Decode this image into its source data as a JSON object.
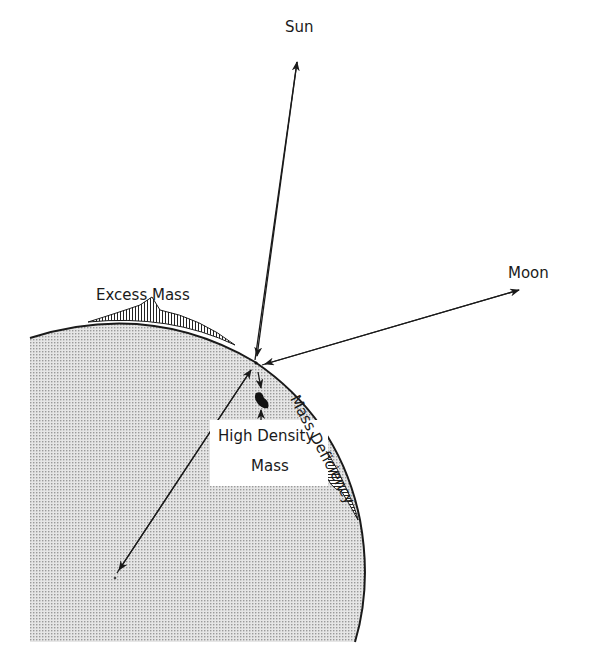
{
  "diagram": {
    "type": "tidal/gravity anomaly cross-section",
    "labels": {
      "sun": "Sun",
      "moon": "Moon",
      "excess_mass": "Excess Mass",
      "high_density_line1": "High Density",
      "high_density_line2": "Mass",
      "mass_deficiency": "Mass Deficiency"
    },
    "colors": {
      "earth_fill": "#d9d9d9",
      "line": "#1a1a1a",
      "background": "#ffffff"
    }
  }
}
